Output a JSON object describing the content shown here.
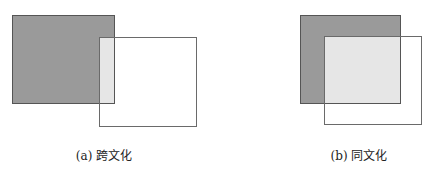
{
  "panels": [
    {
      "id": "a",
      "caption": "(a) 跨文化",
      "description": "small overlap between shaded and outlined squares",
      "colors": {
        "shaded": "#9a9a9a",
        "overlap": "#e6e6e6",
        "outline": "#6a6a6a"
      }
    },
    {
      "id": "b",
      "caption": "(b) 同文化",
      "description": "large overlap between shaded and outlined squares",
      "colors": {
        "shaded": "#9a9a9a",
        "overlap": "#e6e6e6",
        "outline": "#6a6a6a"
      }
    }
  ]
}
